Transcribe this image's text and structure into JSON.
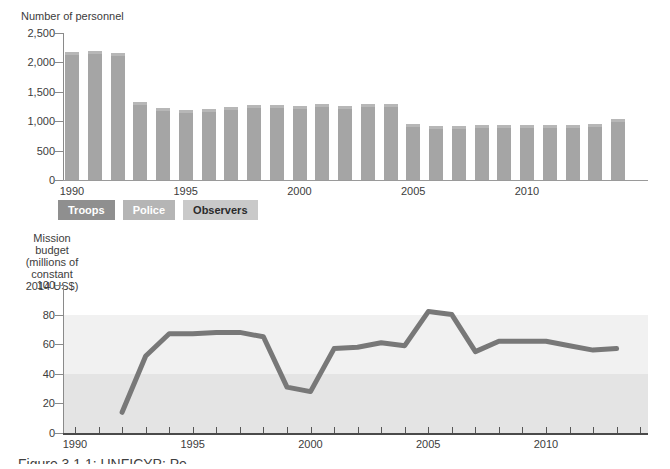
{
  "page": {
    "caption": "Figure 3.1.1: UNFICYP: Pe"
  },
  "personnel_chart": {
    "title": "Number of personnel",
    "y_ticks": [
      "2,500",
      "2,000",
      "1,500",
      "1,000",
      "500",
      "0"
    ],
    "x_ticks": [
      "1990",
      "1995",
      "2000",
      "2005",
      "2010"
    ],
    "legend": [
      {
        "label": "Troops",
        "bg": "#8f8f8f",
        "fg": "#ffffff"
      },
      {
        "label": "Police",
        "bg": "#b5b5b5",
        "fg": "#ffffff"
      },
      {
        "label": "Observers",
        "bg": "#c9c9c9",
        "fg": "#2b2b2b"
      }
    ]
  },
  "budget_chart": {
    "title_lines": [
      "Mission budget",
      "(millions of",
      "constant",
      "2014 US$)"
    ],
    "y_ticks": [
      "100",
      "80",
      "60",
      "40",
      "20",
      "0"
    ],
    "x_ticks": [
      "1990",
      "1995",
      "2000",
      "2005",
      "2010"
    ]
  },
  "chart_data": [
    {
      "type": "bar",
      "title": "Number of personnel",
      "categories": [
        1990,
        1991,
        1992,
        1993,
        1994,
        1995,
        1996,
        1997,
        1998,
        1999,
        2000,
        2001,
        2002,
        2003,
        2004,
        2005,
        2006,
        2007,
        2008,
        2009,
        2010,
        2011,
        2012,
        2013,
        2014
      ],
      "values": [
        2170,
        2190,
        2160,
        1320,
        1220,
        1190,
        1210,
        1240,
        1270,
        1270,
        1260,
        1290,
        1250,
        1300,
        1290,
        950,
        920,
        920,
        930,
        930,
        930,
        940,
        940,
        950,
        1040
      ],
      "ylim": [
        0,
        2500
      ],
      "y_tick_values": [
        2500,
        2000,
        1500,
        1000,
        500,
        0
      ],
      "x_tick_values": [
        1990,
        1995,
        2000,
        2005,
        2010
      ],
      "bar_color": "#a5a5a5",
      "bar_cap_color": "#b7b7b7",
      "legend": [
        "Troops",
        "Police",
        "Observers"
      ],
      "legend_position": "below",
      "grid": false
    },
    {
      "type": "line",
      "title": "Mission budget (millions of constant 2014 US$)",
      "x": [
        1992,
        1993,
        1994,
        1995,
        1996,
        1997,
        1998,
        1999,
        2000,
        2001,
        2002,
        2003,
        2004,
        2005,
        2006,
        2007,
        2008,
        2009,
        2010,
        2011,
        2012,
        2013
      ],
      "values": [
        14,
        52,
        67,
        67,
        68,
        68,
        65,
        31,
        28,
        57,
        58,
        61,
        59,
        82,
        80,
        55,
        62,
        62,
        62,
        59,
        56,
        57
      ],
      "ylim": [
        0,
        100
      ],
      "xlim": [
        1990,
        2014
      ],
      "y_tick_values": [
        100,
        80,
        60,
        40,
        20,
        0
      ],
      "x_tick_values": [
        1990,
        1995,
        2000,
        2005,
        2010
      ],
      "line_color": "#787878",
      "line_width": 5,
      "background_bands": [
        {
          "from": 0,
          "to": 40,
          "color": "#e4e4e4"
        },
        {
          "from": 40,
          "to": 80,
          "color": "#f1f1f1"
        }
      ],
      "grid": false
    }
  ]
}
